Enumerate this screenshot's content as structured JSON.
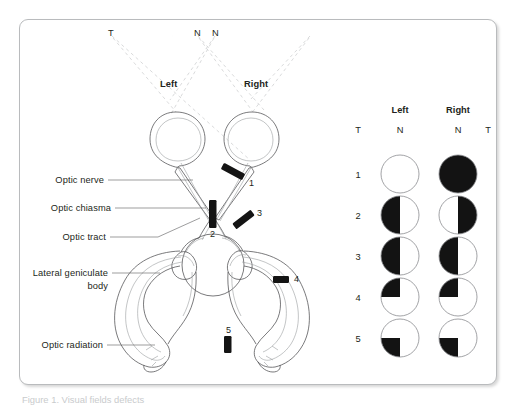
{
  "figure": {
    "border_color": "#b9bbbd",
    "ink": "#231f20",
    "dash_color": "#d2d3d5",
    "lesion_color": "#1a1a1a"
  },
  "anatomy": {
    "side_labels": [
      {
        "name": "left",
        "text": "Left"
      },
      {
        "name": "right",
        "text": "Right"
      }
    ],
    "field_axis_labels": [
      {
        "name": "temporal-left",
        "text": "T"
      },
      {
        "name": "nasal-left",
        "text": "N"
      },
      {
        "name": "nasal-right",
        "text": "N"
      }
    ],
    "structures": [
      {
        "name": "optic-nerve",
        "label": "Optic nerve"
      },
      {
        "name": "optic-chiasma",
        "label": "Optic chiasma"
      },
      {
        "name": "optic-tract",
        "label": "Optic tract"
      },
      {
        "name": "lateral-geniculate-body",
        "label": "Lateral geniculate",
        "label2": "body"
      },
      {
        "name": "optic-radiation",
        "label": "Optic radiation"
      }
    ],
    "lesions": [
      {
        "id": "1",
        "site": "optic nerve"
      },
      {
        "id": "2",
        "site": "optic chiasma"
      },
      {
        "id": "3",
        "site": "optic tract"
      },
      {
        "id": "4",
        "site": "optic radiation (temporal loop)"
      },
      {
        "id": "5",
        "site": "optic radiation (lower fibres)"
      }
    ]
  },
  "visual_fields": {
    "columns": [
      {
        "name": "left-eye",
        "header": "Left"
      },
      {
        "name": "right-eye",
        "header": "Right"
      }
    ],
    "axis_labels": [
      {
        "name": "t-left",
        "text": "T"
      },
      {
        "name": "n-left",
        "text": "N"
      },
      {
        "name": "n-right",
        "text": "N"
      },
      {
        "name": "t-right",
        "text": "T"
      }
    ],
    "rows": [
      {
        "id": "1",
        "left": "none",
        "right": "full"
      },
      {
        "id": "2",
        "left": "left-half",
        "right": "right-half"
      },
      {
        "id": "3",
        "left": "left-half",
        "right": "left-half"
      },
      {
        "id": "4",
        "left": "upper-left-q",
        "right": "upper-left-q"
      },
      {
        "id": "5",
        "left": "lower-left-q",
        "right": "lower-left-q"
      }
    ]
  },
  "caption": {
    "text": "Figure 1. Visual fields defects"
  }
}
